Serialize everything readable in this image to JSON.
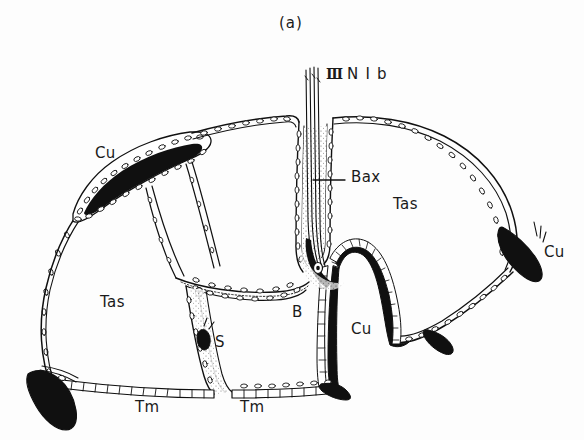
{
  "figure": {
    "panel_caption": "(a)",
    "background_color": "#fdfdfd",
    "ink_color": "#101010",
    "width": 584,
    "height": 440
  },
  "labels": {
    "caption": "(a)",
    "nerve_roman": "Ⅲ",
    "nerve_name": "N I b",
    "bax": "Bax",
    "cuticle_left": "Cu",
    "cuticle_center": "Cu",
    "cuticle_right": "Cu",
    "tergal_apodeme_sac_left": "Tas",
    "tergal_apodeme_sac_right": "Tas",
    "tergal_muscle_left": "Tm",
    "tergal_muscle_right": "Tm",
    "sense_organ": "S",
    "basalar": "B"
  },
  "structures": [
    {
      "name": "body-outline",
      "kind": "epithelial-contour",
      "texture": "beaded-nuclei"
    },
    {
      "name": "cuticle-wedge-upper-left",
      "kind": "sclerite",
      "fill": "solid-black"
    },
    {
      "name": "cuticle-wedge-lower-left",
      "kind": "sclerite",
      "fill": "solid-black"
    },
    {
      "name": "cuticle-wedge-right",
      "kind": "sclerite",
      "fill": "solid-black"
    },
    {
      "name": "cuticle-ridge-center",
      "kind": "sclerite",
      "fill": "solid-black"
    },
    {
      "name": "basalar-apodeme-column",
      "kind": "apodeme",
      "texture": "stippled"
    },
    {
      "name": "nerve-bundle",
      "kind": "nerve",
      "texture": "parallel-fibres"
    },
    {
      "name": "tergal-muscle-floor",
      "kind": "muscle-attachment",
      "texture": "ladder-cells"
    }
  ]
}
